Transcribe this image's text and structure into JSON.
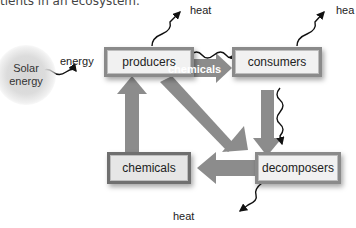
{
  "caption": "tients in an ecosystem.",
  "nodes": {
    "solar": "Solar energy",
    "producers": "producers",
    "consumers": "consumers",
    "chemicals": "chemicals",
    "decomposers": "decomposers"
  },
  "labels": {
    "energy": "energy",
    "heat_top_left": "heat",
    "heat_top_right": "hea",
    "heat_bottom": "heat",
    "chemicals_arrow": "chemicals"
  },
  "colors": {
    "arrow": "#8c8c8c",
    "box_border": "#8a8a8a",
    "box_fill": "#f1f1f1"
  }
}
